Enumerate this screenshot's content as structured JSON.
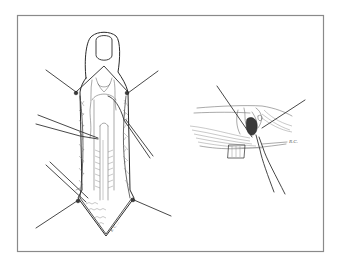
{
  "figure": {
    "left_panel": {
      "subject": "finger-incision-with-retractors",
      "signature": "R. C. ..."
    },
    "right_panel": {
      "subject": "tendon-detail-with-instruments",
      "label": "R.C."
    },
    "colors": {
      "frame": "#8a8a8a",
      "ink": "#2a2a2a",
      "background": "#ffffff"
    }
  }
}
